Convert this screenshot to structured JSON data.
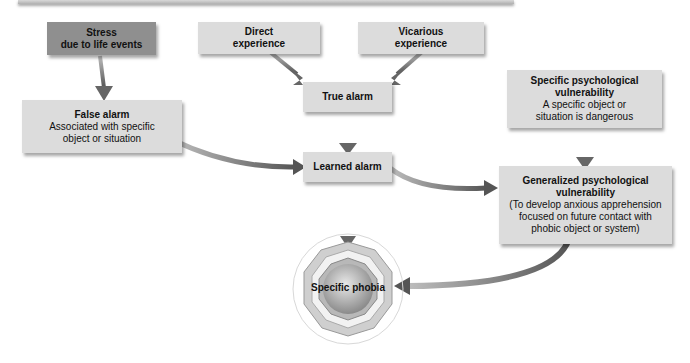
{
  "diagram": {
    "nodes": {
      "stress": {
        "title": "Stress",
        "subtitle": "due to life events"
      },
      "direct": {
        "title": "Direct",
        "subtitle": "experience"
      },
      "vicarious": {
        "title": "Vicarious",
        "subtitle": "experience"
      },
      "false_alarm": {
        "title": "False alarm",
        "line1": "Associated with specific",
        "line2": "object or situation"
      },
      "true_alarm": {
        "title": "True alarm"
      },
      "specific_vuln": {
        "title1": "Specific psychological",
        "title2": "vulnerability",
        "line1": "A specific object or",
        "line2": "situation is dangerous"
      },
      "learned_alarm": {
        "title": "Learned alarm"
      },
      "general_vuln": {
        "title1": "Generalized psychological",
        "title2": "vulnerability",
        "line1": "(To develop anxious apprehension",
        "line2": "focused on future contact with",
        "line3": "phobic object or system)"
      },
      "phobia": {
        "title": "Specific phobia"
      }
    },
    "edges": [
      [
        "stress",
        "false_alarm"
      ],
      [
        "direct",
        "true_alarm"
      ],
      [
        "vicarious",
        "true_alarm"
      ],
      [
        "true_alarm",
        "learned_alarm"
      ],
      [
        "false_alarm",
        "learned_alarm"
      ],
      [
        "learned_alarm",
        "general_vuln"
      ],
      [
        "specific_vuln",
        "general_vuln"
      ],
      [
        "general_vuln",
        "phobia"
      ],
      [
        "above",
        "phobia"
      ]
    ],
    "colors": {
      "box": "#dcdcdc",
      "dark_box": "#8f8f8f",
      "arrow": "#6e6e6e"
    }
  }
}
